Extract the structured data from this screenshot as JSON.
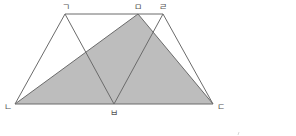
{
  "diagram": {
    "type": "geometry",
    "colors": {
      "line": "#6b6b6b",
      "shade": "#bdbdbd",
      "label": "#555555"
    },
    "points": {
      "giyeok": {
        "label": "ㄱ",
        "x": 65,
        "y": 14
      },
      "mieum": {
        "label": "ㅁ",
        "x": 138,
        "y": 14
      },
      "rieul": {
        "label": "ㄹ",
        "x": 163,
        "y": 14
      },
      "nieun": {
        "label": "ㄴ",
        "x": 15,
        "y": 104
      },
      "bieup": {
        "label": "ㅂ",
        "x": 114,
        "y": 104
      },
      "digeut": {
        "label": "ㄷ",
        "x": 213,
        "y": 104
      }
    },
    "shaded_triangle": [
      "ㄴ",
      "ㅁ",
      "ㄷ"
    ],
    "segments": [
      [
        "ㄱ",
        "ㄹ"
      ],
      [
        "ㄴ",
        "ㄷ"
      ],
      [
        "ㄱ",
        "ㄴ"
      ],
      [
        "ㄹ",
        "ㄷ"
      ],
      [
        "ㄱ",
        "ㅂ"
      ],
      [
        "ㄹ",
        "ㅂ"
      ],
      [
        "ㄴ",
        "ㅁ"
      ],
      [
        "ㅁ",
        "ㄷ"
      ]
    ]
  }
}
